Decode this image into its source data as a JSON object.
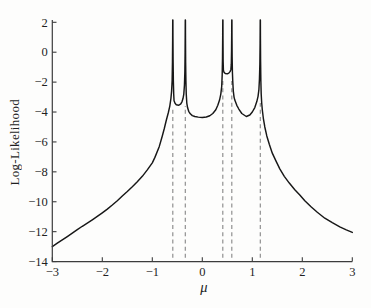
{
  "chart_data": {
    "type": "line",
    "title": "",
    "xlabel": "μ",
    "ylabel": "Log-Likelihood",
    "xlim": [
      -3,
      3
    ],
    "ylim": [
      -14,
      2
    ],
    "xticks": [
      -3,
      -2,
      -1,
      0,
      1,
      2,
      3
    ],
    "yticks": [
      2,
      0,
      -2,
      -4,
      -6,
      -8,
      -10,
      -12,
      -14
    ],
    "grid": false,
    "legend": "none",
    "data_points": [
      -0.59,
      -0.34,
      0.41,
      0.59,
      1.16
    ],
    "dashed_line_tops": [
      -3.7,
      -3.6,
      -1.7,
      -1.7,
      -3.4
    ],
    "colors": {
      "curve": "#171717",
      "dashes": "#8b8b8b",
      "axis": "#3c3c3c",
      "text": "#1f1f1f",
      "background": "#fdfdfc"
    },
    "series": [
      {
        "name": "log-likelihood",
        "points": [
          [
            -3.0,
            -13.0
          ],
          [
            -2.9,
            -12.77
          ],
          [
            -2.8,
            -12.55
          ],
          [
            -2.7,
            -12.33
          ],
          [
            -2.6,
            -12.1
          ],
          [
            -2.5,
            -11.87
          ],
          [
            -2.4,
            -11.64
          ],
          [
            -2.3,
            -11.43
          ],
          [
            -2.2,
            -11.21
          ],
          [
            -2.1,
            -10.98
          ],
          [
            -2.0,
            -10.74
          ],
          [
            -1.9,
            -10.49
          ],
          [
            -1.8,
            -10.22
          ],
          [
            -1.7,
            -9.93
          ],
          [
            -1.6,
            -9.62
          ],
          [
            -1.5,
            -9.32
          ],
          [
            -1.4,
            -9.0
          ],
          [
            -1.3,
            -8.66
          ],
          [
            -1.2,
            -8.3
          ],
          [
            -1.1,
            -7.87
          ],
          [
            -1.0,
            -7.4
          ],
          [
            -0.95,
            -7.05
          ],
          [
            -0.86,
            -6.3
          ],
          [
            -0.8,
            -5.6
          ],
          [
            -0.76,
            -5.1
          ],
          [
            -0.72,
            -4.55
          ],
          [
            -0.68,
            -4.05
          ],
          [
            -0.65,
            -3.6
          ],
          [
            -0.628,
            -3.1
          ],
          [
            -0.614,
            -2.6
          ],
          [
            -0.603,
            -1.9
          ],
          [
            -0.597,
            -0.7
          ],
          [
            -0.593,
            0.9
          ],
          [
            -0.5915,
            2.15
          ],
          [
            -0.5885,
            2.15
          ],
          [
            -0.587,
            1.0
          ],
          [
            -0.584,
            -0.5
          ],
          [
            -0.579,
            -1.9
          ],
          [
            -0.572,
            -2.8
          ],
          [
            -0.565,
            -3.25
          ],
          [
            -0.545,
            -3.42
          ],
          [
            -0.52,
            -3.51
          ],
          [
            -0.47,
            -3.55
          ],
          [
            -0.43,
            -3.45
          ],
          [
            -0.405,
            -3.3
          ],
          [
            -0.386,
            -3.1
          ],
          [
            -0.37,
            -2.8
          ],
          [
            -0.357,
            -2.2
          ],
          [
            -0.349,
            -1.3
          ],
          [
            -0.344,
            0.0
          ],
          [
            -0.3415,
            1.5
          ],
          [
            -0.3405,
            2.15
          ],
          [
            -0.3375,
            2.15
          ],
          [
            -0.336,
            0.9
          ],
          [
            -0.333,
            -0.7
          ],
          [
            -0.328,
            -1.9
          ],
          [
            -0.321,
            -2.8
          ],
          [
            -0.31,
            -3.4
          ],
          [
            -0.295,
            -3.7
          ],
          [
            -0.272,
            -3.95
          ],
          [
            -0.24,
            -4.12
          ],
          [
            -0.2,
            -4.24
          ],
          [
            -0.15,
            -4.3
          ],
          [
            -0.08,
            -4.34
          ],
          [
            0.0,
            -4.36
          ],
          [
            0.08,
            -4.33
          ],
          [
            0.15,
            -4.25
          ],
          [
            0.21,
            -4.1
          ],
          [
            0.27,
            -3.85
          ],
          [
            0.31,
            -3.55
          ],
          [
            0.345,
            -3.2
          ],
          [
            0.37,
            -2.8
          ],
          [
            0.388,
            -2.3
          ],
          [
            0.398,
            -1.5
          ],
          [
            0.404,
            -0.4
          ],
          [
            0.408,
            1.1
          ],
          [
            0.4095,
            2.15
          ],
          [
            0.4125,
            2.15
          ],
          [
            0.414,
            0.8
          ],
          [
            0.417,
            -0.6
          ],
          [
            0.422,
            -1.2
          ],
          [
            0.435,
            -1.35
          ],
          [
            0.46,
            -1.42
          ],
          [
            0.5,
            -1.45
          ],
          [
            0.53,
            -1.4
          ],
          [
            0.555,
            -1.3
          ],
          [
            0.572,
            -1.15
          ],
          [
            0.58,
            -0.8
          ],
          [
            0.585,
            0.1
          ],
          [
            0.588,
            1.3
          ],
          [
            0.5895,
            2.15
          ],
          [
            0.5925,
            2.15
          ],
          [
            0.594,
            1.0
          ],
          [
            0.597,
            -0.3
          ],
          [
            0.602,
            -1.3
          ],
          [
            0.61,
            -2.0
          ],
          [
            0.62,
            -2.6
          ],
          [
            0.635,
            -3.0
          ],
          [
            0.65,
            -3.2
          ],
          [
            0.69,
            -3.55
          ],
          [
            0.73,
            -3.8
          ],
          [
            0.79,
            -4.1
          ],
          [
            0.88,
            -4.3
          ],
          [
            0.95,
            -4.2
          ],
          [
            1.0,
            -4.0
          ],
          [
            1.05,
            -3.7
          ],
          [
            1.09,
            -3.3
          ],
          [
            1.115,
            -2.95
          ],
          [
            1.132,
            -2.5
          ],
          [
            1.143,
            -1.8
          ],
          [
            1.151,
            -0.8
          ],
          [
            1.156,
            0.6
          ],
          [
            1.1585,
            2.15
          ],
          [
            1.1615,
            2.15
          ],
          [
            1.163,
            0.9
          ],
          [
            1.166,
            -0.6
          ],
          [
            1.171,
            -1.9
          ],
          [
            1.178,
            -2.8
          ],
          [
            1.188,
            -3.4
          ],
          [
            1.2,
            -3.85
          ],
          [
            1.22,
            -4.4
          ],
          [
            1.25,
            -5.0
          ],
          [
            1.29,
            -5.6
          ],
          [
            1.34,
            -6.15
          ],
          [
            1.4,
            -6.75
          ],
          [
            1.47,
            -7.25
          ],
          [
            1.55,
            -7.8
          ],
          [
            1.64,
            -8.3
          ],
          [
            1.74,
            -8.75
          ],
          [
            1.85,
            -9.2
          ],
          [
            1.95,
            -9.55
          ],
          [
            2.05,
            -9.93
          ],
          [
            2.18,
            -10.35
          ],
          [
            2.3,
            -10.7
          ],
          [
            2.45,
            -11.1
          ],
          [
            2.6,
            -11.4
          ],
          [
            2.75,
            -11.68
          ],
          [
            2.88,
            -11.88
          ],
          [
            3.0,
            -12.05
          ]
        ]
      }
    ]
  }
}
